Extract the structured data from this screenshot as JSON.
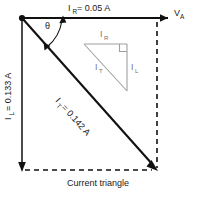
{
  "figure": {
    "caption": "Current triangle",
    "angle_symbol": "θ",
    "colors": {
      "vector_stroke": "#111111",
      "inner_triangle_stroke": "#a0a0a0",
      "text": "#1a1a1a",
      "inner_triangle_text": "#6f6f6f",
      "background": "#ffffff"
    }
  },
  "vectors": {
    "horizontal": {
      "symbol": "I",
      "subscript": "R",
      "equals": "= 0.05 A",
      "full_label": "I_R = 0.05 A",
      "value": 0.05,
      "unit": "A"
    },
    "vertical": {
      "symbol": "I",
      "subscript": "L",
      "equals": "= 0.133 A",
      "full_label": "I_L = 0.133 A",
      "value": 0.133,
      "unit": "A"
    },
    "diagonal": {
      "symbol": "I",
      "subscript": "T",
      "equals": "= 0.142 A",
      "full_label": "I_T = 0.142 A",
      "value": 0.142,
      "unit": "A"
    },
    "axis": {
      "symbol": "V",
      "subscript": "A",
      "full_label": "V_A"
    }
  },
  "inner_triangle": {
    "top_side": {
      "symbol": "I",
      "subscript": "R"
    },
    "right_side": {
      "symbol": "I",
      "subscript": "L"
    },
    "hypotenuse": {
      "symbol": "I",
      "subscript": "T"
    }
  }
}
